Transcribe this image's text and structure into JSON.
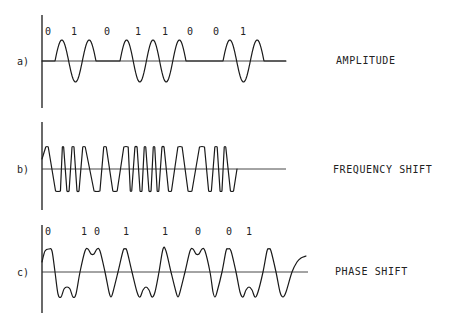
{
  "figure": {
    "bit_sequence": [
      0,
      1,
      0,
      1,
      1,
      0,
      0,
      1
    ],
    "panels": [
      {
        "id": "a",
        "label": "a)",
        "title": "AMPLITUDE",
        "modulation": "amplitude-shift keying (carrier on for 1, off for 0)",
        "bit_labels": [
          "0",
          "1",
          "0",
          "1",
          "1",
          "0",
          "0",
          "1"
        ]
      },
      {
        "id": "b",
        "label": "b)",
        "title": "FREQUENCY SHIFT",
        "modulation": "frequency-shift keying (higher frequency for 1, lower for 0)",
        "bit_labels": []
      },
      {
        "id": "c",
        "label": "c)",
        "title": "PHASE SHIFT",
        "modulation": "phase-shift keying (phase reversal at bit changes)",
        "bit_labels": [
          "0",
          "1",
          "0",
          "1",
          "1",
          "0",
          "0",
          "1"
        ]
      }
    ]
  },
  "colors": {
    "ink": "#1a1a1a",
    "background": "#ffffff"
  }
}
